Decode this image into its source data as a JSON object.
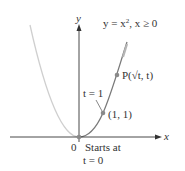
{
  "diagram": {
    "type": "parametric-curve-graph",
    "axes": {
      "x_label": "x",
      "y_label": "y",
      "origin_label": "0"
    },
    "curve_label": "y = x², x ≥ 0",
    "curve_label_parts": {
      "lhs": "y = x",
      "exp": "2",
      "rhs": ", x ≥ 0"
    },
    "points": [
      {
        "name": "P",
        "label": "P(√t, t)",
        "x": 1.58,
        "y": 2.5
      },
      {
        "name": "one-one",
        "label": "(1, 1)",
        "x": 1,
        "y": 1
      },
      {
        "name": "origin",
        "label": "0",
        "x": 0,
        "y": 0
      }
    ],
    "annotations": {
      "t_equals_1": "t = 1",
      "starts_at": "Starts at",
      "t_equals_0": "t = 0"
    },
    "colors": {
      "axis": "#333333",
      "curve_traced": "#7a7a7a",
      "curve_full": "#c8c8c8",
      "point": "#8a8a8a",
      "direction_arrow": "#b0b0b0"
    }
  }
}
